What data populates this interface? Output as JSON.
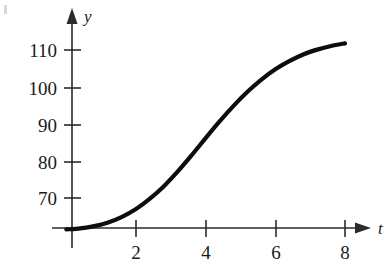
{
  "chart_data": {
    "type": "line",
    "title": "",
    "subtitle": "",
    "xlabel": "t",
    "ylabel": "y",
    "grid": false,
    "legend": null,
    "xlim": [
      0,
      8.6
    ],
    "ylim": [
      58,
      116
    ],
    "x_ticks": [
      2,
      4,
      6,
      8
    ],
    "x_tick_labels": [
      "2",
      "4",
      "6",
      "8"
    ],
    "y_ticks": [
      70,
      80,
      90,
      100,
      110
    ],
    "y_tick_labels": [
      "70",
      "80",
      "90",
      "100",
      "110"
    ],
    "series": [
      {
        "name": "y(t)",
        "color": "#0d0d0d",
        "x": [
          0.0,
          0.4,
          0.8,
          1.2,
          1.6,
          2.0,
          2.4,
          2.8,
          3.2,
          3.6,
          4.0,
          4.4,
          4.8,
          5.2,
          5.6,
          6.0,
          6.4,
          6.8,
          7.2,
          7.6,
          8.0
        ],
        "values": [
          61.5,
          61.8,
          62.4,
          63.4,
          64.9,
          67.0,
          69.8,
          73.2,
          77.2,
          81.6,
          86.2,
          90.7,
          94.9,
          98.7,
          102.0,
          104.8,
          107.0,
          108.8,
          110.1,
          111.1,
          111.8
        ]
      }
    ],
    "annotations": [],
    "axis_style": {
      "x_axis_arrow": true,
      "y_axis_arrow": true,
      "origin_value_y": 61.5
    }
  },
  "figure": {
    "y_axis_label": "y",
    "x_axis_label": "t",
    "background_color": "#ffffff",
    "curve_color": "#0d0d0d",
    "axis_color": "#2b2b2b"
  }
}
